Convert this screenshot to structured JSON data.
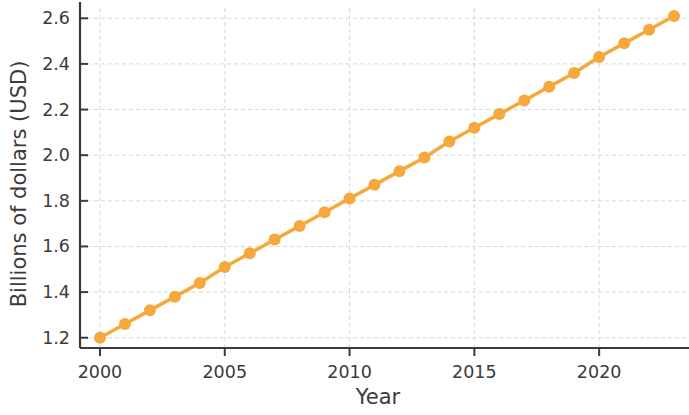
{
  "chart_data": {
    "type": "line",
    "title": "",
    "subtitle": "",
    "xlabel": "Year",
    "ylabel": "Billions of dollars (USD)",
    "x": [
      2000,
      2001,
      2002,
      2003,
      2004,
      2005,
      2006,
      2007,
      2008,
      2009,
      2010,
      2011,
      2012,
      2013,
      2014,
      2015,
      2016,
      2017,
      2018,
      2019,
      2020,
      2021,
      2022,
      2023
    ],
    "values": [
      1.2,
      1.26,
      1.32,
      1.38,
      1.44,
      1.51,
      1.57,
      1.63,
      1.69,
      1.75,
      1.81,
      1.87,
      1.93,
      1.99,
      2.06,
      2.12,
      2.18,
      2.24,
      2.3,
      2.36,
      2.43,
      2.49,
      2.55,
      2.61
    ],
    "series": [
      {
        "name": "Billions of dollars (USD)",
        "color": "#f5a83c",
        "marker": "circle",
        "values": [
          1.2,
          1.26,
          1.32,
          1.38,
          1.44,
          1.51,
          1.57,
          1.63,
          1.69,
          1.75,
          1.81,
          1.87,
          1.93,
          1.99,
          2.06,
          2.12,
          2.18,
          2.24,
          2.3,
          2.36,
          2.43,
          2.49,
          2.55,
          2.61
        ]
      }
    ],
    "xlim": [
      1999.2,
      2023.6
    ],
    "ylim": [
      1.155,
      2.645
    ],
    "xticks": [
      2000,
      2005,
      2010,
      2015,
      2020
    ],
    "xticklabels": [
      "2000",
      "2005",
      "2010",
      "2015",
      "2020"
    ],
    "yticks": [
      1.2,
      1.4,
      1.6,
      1.8,
      2.0,
      2.2,
      2.4,
      2.6
    ],
    "yticklabels": [
      "1.2",
      "1.4",
      "1.6",
      "1.8",
      "2.0",
      "2.2",
      "2.4",
      "2.6"
    ],
    "grid": true,
    "grid_style": "dashed",
    "grid_color": "#d8d8d8",
    "legend": false,
    "legend_position": "none",
    "background": "#ffffff",
    "axis_color": "#3b3b3b",
    "line_width": 3.5,
    "marker_size": 9
  },
  "axes": {
    "x_label": "Year",
    "y_label": "Billions of dollars (USD)"
  }
}
